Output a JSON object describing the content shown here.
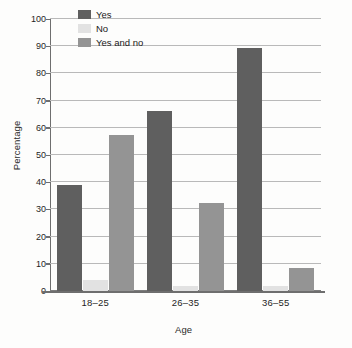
{
  "chart_data": {
    "type": "bar",
    "title": "",
    "subtitle": "",
    "xlabel": "Age",
    "ylabel": "Percentage",
    "categories": [
      "18–25",
      "26–35",
      "36–55"
    ],
    "series": [
      {
        "name": "Yes",
        "values": [
          39,
          66,
          89.5
        ],
        "color": "#5f5f5f"
      },
      {
        "name": "No",
        "values": [
          4,
          2,
          2
        ],
        "color": "#e2e2e2"
      },
      {
        "name": "Yes and no",
        "values": [
          57.5,
          32.5,
          8.5
        ],
        "color": "#949494"
      }
    ],
    "ylim": [
      0,
      100
    ],
    "ytick_labels": [
      "0",
      "10",
      "20",
      "30",
      "40",
      "50",
      "60",
      "70",
      "80",
      "90",
      "100"
    ],
    "ytick_values": [
      0,
      10,
      20,
      30,
      40,
      50,
      60,
      70,
      80,
      90,
      100
    ],
    "grid": "horizontal",
    "legend_position": "upper-left-inside",
    "annotations": []
  },
  "legend": {
    "items": [
      {
        "label": "Yes"
      },
      {
        "label": "No"
      },
      {
        "label": "Yes and no"
      }
    ]
  }
}
